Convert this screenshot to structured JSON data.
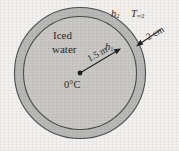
{
  "figure": {
    "background_color": "#f3f1ef",
    "shell_color": "#b9b9b7",
    "interior_color": "#c9c8c5",
    "outline_color": "#4a4a4a",
    "text_color": "#2b2b2b"
  },
  "labels": {
    "contents_line1": "Iced",
    "contents_line2": "water",
    "inner_coefficient": "h",
    "inner_coefficient_sub": "1",
    "outer_coefficient": "h",
    "outer_coefficient_sub": "2",
    "ambient_temp": "T",
    "ambient_temp_sub": "∞2",
    "shell_thickness": "2 cm",
    "radius": "1.5 m",
    "center_temp": "0°C"
  },
  "geometry": {
    "center_x": 80,
    "center_y": 73,
    "outer_radius": 66,
    "inner_radius": 57,
    "radius_arrow_angle_deg": -29,
    "thickness_arrow_from": [
      160,
      30
    ],
    "thickness_arrow_to": [
      136,
      46
    ]
  }
}
